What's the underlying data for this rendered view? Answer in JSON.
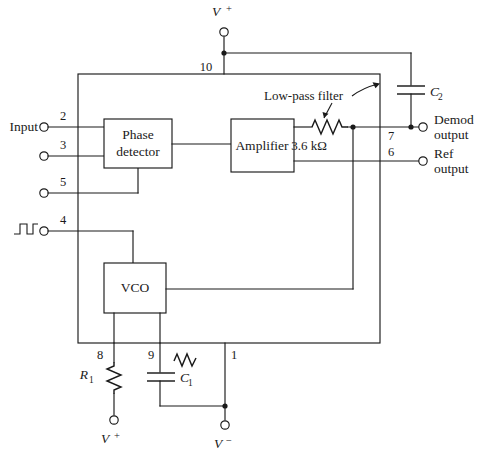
{
  "figure": {
    "type": "circuit-schematic"
  },
  "blocks": [
    {
      "id": "phase-detector",
      "line1": "Phase",
      "line2": "detector"
    },
    {
      "id": "amplifier",
      "line1": "Amplifier",
      "line2": ""
    },
    {
      "id": "vco",
      "line1": "VCO",
      "line2": ""
    }
  ],
  "annotations": {
    "low_pass_filter": "Low-pass filter",
    "filter_resistor_value": "3.6 kΩ"
  },
  "components": {
    "c2_label": "C",
    "c2_sub": "2",
    "c1_label": "C",
    "c1_sub": "1",
    "r1_label": "R",
    "r1_sub": "1"
  },
  "supplies": {
    "top_positive": "V",
    "top_positive_sign": "+",
    "bottom_positive": "V",
    "bottom_positive_sign": "+",
    "bottom_negative": "V",
    "bottom_negative_sign": "−"
  },
  "pins": [
    {
      "number": "10",
      "x": 206,
      "y": 71,
      "role": "supply-positive"
    },
    {
      "number": "2",
      "x": 63,
      "y": 120,
      "role": "input"
    },
    {
      "number": "3",
      "x": 63,
      "y": 149,
      "role": "input"
    },
    {
      "number": "5",
      "x": 63,
      "y": 186,
      "role": "input"
    },
    {
      "number": "4",
      "x": 63,
      "y": 224,
      "role": "input-square-wave"
    },
    {
      "number": "7",
      "x": 391,
      "y": 140,
      "role": "demod-output"
    },
    {
      "number": "6",
      "x": 391,
      "y": 154,
      "role": "ref-output"
    },
    {
      "number": "8",
      "x": 100,
      "y": 359,
      "role": "timing-resistor"
    },
    {
      "number": "9",
      "x": 151,
      "y": 359,
      "role": "timing-capacitor"
    },
    {
      "number": "1",
      "x": 234,
      "y": 359,
      "role": "supply-negative"
    }
  ],
  "terminal_labels": {
    "input": "Input",
    "demod_output_line1": "Demod",
    "demod_output_line2": "output",
    "ref_output_line1": "Ref",
    "ref_output_line2": "output"
  },
  "colors": {
    "line": "#1a1a1a",
    "background": "#ffffff"
  }
}
